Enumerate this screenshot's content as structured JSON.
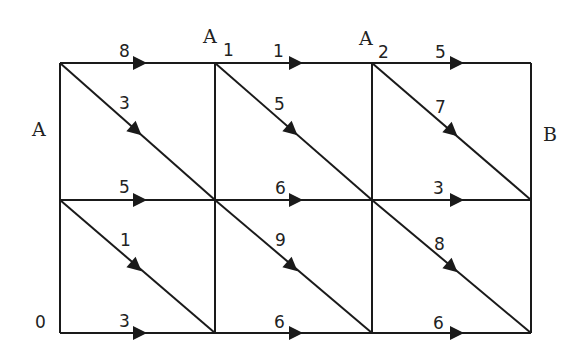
{
  "diagram": {
    "type": "directed weighted grid graph",
    "node_labels": {
      "A": "A",
      "A1": {
        "base": "A",
        "sub": "1"
      },
      "A2": {
        "base": "A",
        "sub": "2"
      },
      "B": "B",
      "O": "0"
    },
    "grid": {
      "xs": [
        60,
        215,
        372,
        531
      ],
      "ys": [
        63,
        200,
        333
      ]
    },
    "edges": {
      "top_row": [
        "8",
        "1",
        "5"
      ],
      "middle_row": [
        "5",
        "6",
        "3"
      ],
      "bottom_row": [
        "3",
        "6",
        "6"
      ],
      "upper_diagonals": [
        "3",
        "5",
        "7"
      ],
      "lower_diagonals": [
        "1",
        "9",
        "8"
      ]
    }
  }
}
